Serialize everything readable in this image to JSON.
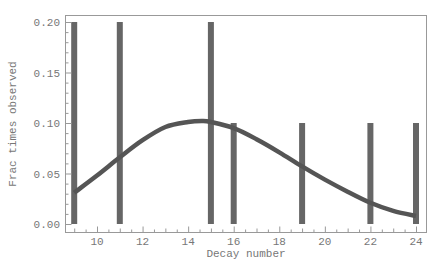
{
  "chart_data": {
    "type": "bar",
    "title": "",
    "xlabel": "Decay number",
    "ylabel": "Frac times observed",
    "xlim": [
      8.6,
      24.45
    ],
    "ylim": [
      -0.008,
      0.208
    ],
    "x_ticks": [
      10,
      12,
      14,
      16,
      18,
      20,
      22,
      24
    ],
    "x_tick_labels": [
      "10",
      "12",
      "14",
      "16",
      "18",
      "20",
      "22",
      "24"
    ],
    "y_ticks": [
      0.0,
      0.05,
      0.1,
      0.15,
      0.2
    ],
    "y_tick_labels": [
      "0.00",
      "0.05",
      "0.10",
      "0.15",
      "0.20"
    ],
    "grid": false,
    "legend": null,
    "series": [
      {
        "name": "observed",
        "type": "bar",
        "color": "#666666",
        "x": [
          9,
          11,
          15,
          16,
          19,
          22,
          24
        ],
        "values": [
          0.2,
          0.2,
          0.2,
          0.1,
          0.1,
          0.1,
          0.1
        ]
      },
      {
        "name": "fit",
        "type": "line",
        "color": "#555555",
        "x": [
          9,
          10,
          11,
          12,
          13,
          14,
          14.6,
          15,
          16,
          17,
          18,
          19,
          20,
          21,
          22,
          23,
          24
        ],
        "values": [
          0.031,
          0.048,
          0.066,
          0.083,
          0.096,
          0.101,
          0.102,
          0.101,
          0.095,
          0.084,
          0.071,
          0.057,
          0.044,
          0.032,
          0.021,
          0.013,
          0.008
        ]
      }
    ]
  }
}
